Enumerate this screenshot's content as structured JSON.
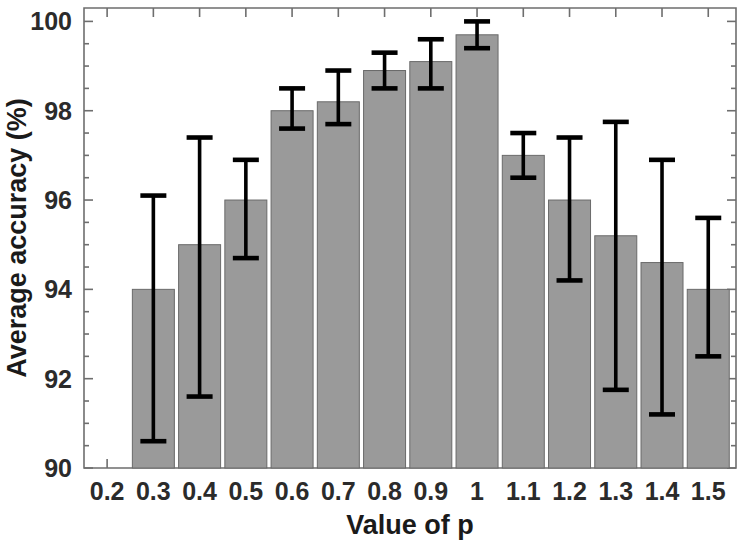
{
  "chart_data": {
    "type": "bar",
    "title": "",
    "subtitle": "",
    "xlabel": "Value of p",
    "ylabel": "Average accuracy (%)",
    "categories": [
      "0.3",
      "0.4",
      "0.5",
      "0.6",
      "0.7",
      "0.8",
      "0.9",
      "1",
      "1.1",
      "1.2",
      "1.3",
      "1.4",
      "1.5"
    ],
    "values": [
      94.0,
      95.0,
      96.0,
      98.0,
      98.2,
      98.9,
      99.1,
      99.7,
      97.0,
      96.0,
      95.2,
      94.6,
      94.0
    ],
    "error_low": [
      90.6,
      91.6,
      94.7,
      97.6,
      97.7,
      98.5,
      98.5,
      99.4,
      96.5,
      94.2,
      91.75,
      91.2,
      92.5
    ],
    "error_high": [
      96.1,
      97.4,
      96.9,
      98.5,
      98.9,
      99.3,
      99.6,
      100.0,
      97.5,
      97.4,
      97.75,
      96.9,
      95.6
    ],
    "x_tick_labels": [
      "0.2",
      "0.3",
      "0.4",
      "0.5",
      "0.6",
      "0.7",
      "0.8",
      "0.9",
      "1",
      "1.1",
      "1.2",
      "1.3",
      "1.4",
      "1.5"
    ],
    "y_tick_labels": [
      "90",
      "92",
      "94",
      "96",
      "98",
      "100"
    ],
    "y_tick_values": [
      90,
      92,
      94,
      96,
      98,
      100
    ],
    "ylim": [
      90,
      100.3
    ],
    "xlim": [
      0.15,
      1.56
    ],
    "grid": false,
    "legend": "none",
    "bar_color": "#9a9a9a",
    "bar_edge_color": "#6a6a6a",
    "error_color": "#000000",
    "axis_color": "#6e6e6e",
    "error_bar_style": "capped-vertical"
  },
  "axes": {
    "x_title": "Value of p",
    "y_title": "Average accuracy (%)"
  }
}
